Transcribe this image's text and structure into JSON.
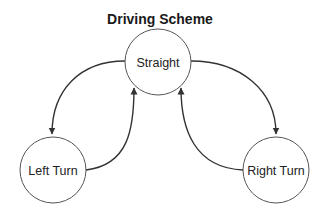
{
  "title": "Driving Scheme",
  "nodes": {
    "straight": {
      "label": "Straight",
      "cx": 158,
      "cy": 62,
      "r": 33
    },
    "left_turn": {
      "label": "Left Turn",
      "cx": 53,
      "cy": 170,
      "r": 33
    },
    "right_turn": {
      "label": "Right Turn",
      "cx": 276,
      "cy": 170,
      "r": 33
    }
  },
  "edges": [
    {
      "from": "Straight",
      "to": "Left Turn"
    },
    {
      "from": "Left Turn",
      "to": "Straight"
    },
    {
      "from": "Straight",
      "to": "Right Turn"
    },
    {
      "from": "Right Turn",
      "to": "Straight"
    }
  ],
  "colors": {
    "stroke": "#333333",
    "node_border": "#555555",
    "text": "#222222",
    "background": "#ffffff"
  }
}
